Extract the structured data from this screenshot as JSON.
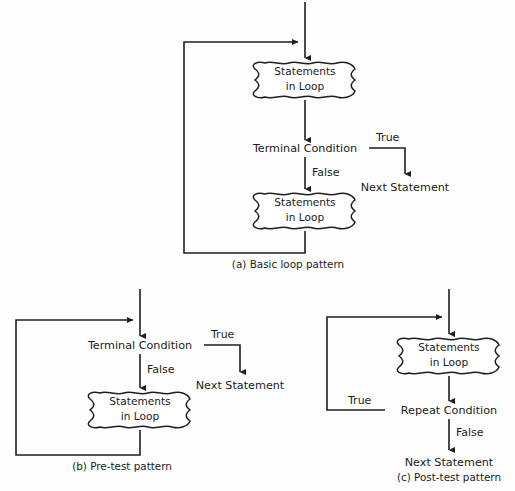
{
  "figure": {
    "background_color": "#fefefe",
    "line_color": "#1e1e1e",
    "text_color": "#1b1b1b"
  },
  "labels": {
    "statements_in_loop_line1": "Statements",
    "statements_in_loop_line2": "in Loop",
    "terminal_condition": "Terminal Condition",
    "repeat_condition": "Repeat Condition",
    "next_statement": "Next Statement",
    "true": "True",
    "false": "False"
  },
  "diagrams": [
    {
      "id": "a",
      "caption": "(a) Basic loop pattern",
      "nodes": [
        {
          "name": "statements-in-loop-top",
          "type": "process-cloud",
          "line1": "Statements",
          "line2": "in Loop"
        },
        {
          "name": "terminal-condition",
          "type": "condition",
          "text": "Terminal Condition"
        },
        {
          "name": "statements-in-loop-bottom",
          "type": "process-cloud",
          "line1": "Statements",
          "line2": "in Loop"
        },
        {
          "name": "next-statement",
          "type": "terminator",
          "text": "Next Statement"
        }
      ],
      "edge_labels": [
        {
          "name": "edge-label-true",
          "text": "True"
        },
        {
          "name": "edge-label-false",
          "text": "False"
        }
      ]
    },
    {
      "id": "b",
      "caption": "(b) Pre-test pattern",
      "nodes": [
        {
          "name": "terminal-condition",
          "type": "condition",
          "text": "Terminal Condition"
        },
        {
          "name": "statements-in-loop",
          "type": "process-cloud",
          "line1": "Statements",
          "line2": "in Loop"
        },
        {
          "name": "next-statement",
          "type": "terminator",
          "text": "Next Statement"
        }
      ],
      "edge_labels": [
        {
          "name": "edge-label-true",
          "text": "True"
        },
        {
          "name": "edge-label-false",
          "text": "False"
        }
      ]
    },
    {
      "id": "c",
      "caption": "(c) Post-test pattern",
      "nodes": [
        {
          "name": "statements-in-loop",
          "type": "process-cloud",
          "line1": "Statements",
          "line2": "in Loop"
        },
        {
          "name": "repeat-condition",
          "type": "condition",
          "text": "Repeat Condition"
        },
        {
          "name": "next-statement",
          "type": "terminator",
          "text": "Next Statement"
        }
      ],
      "edge_labels": [
        {
          "name": "edge-label-true",
          "text": "True"
        },
        {
          "name": "edge-label-false",
          "text": "False"
        }
      ]
    }
  ]
}
